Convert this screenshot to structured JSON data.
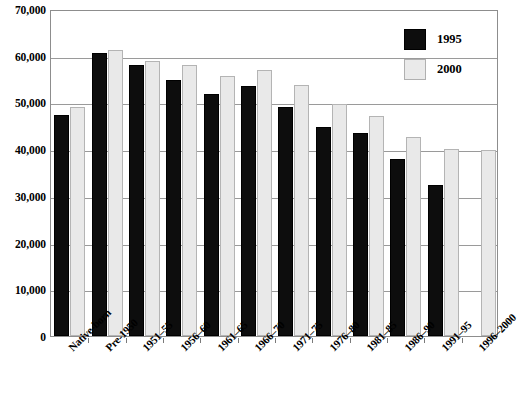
{
  "chart_data": {
    "type": "bar",
    "title": "",
    "xlabel": "",
    "ylabel": "",
    "ylim": [
      0,
      70000
    ],
    "yticks": [
      "0",
      "10,000",
      "20,000",
      "30,000",
      "40,000",
      "50,000",
      "60,000",
      "70,000"
    ],
    "ytick_values": [
      0,
      10000,
      20000,
      30000,
      40000,
      50000,
      60000,
      70000
    ],
    "grid": true,
    "legend_position": "top-right",
    "categories": [
      "Native-born",
      "Pre-1950",
      "1951–55",
      "1956–60",
      "1961–65",
      "1966–70",
      "1971–75",
      "1976–80",
      "1981–85",
      "1986–90",
      "1991–95",
      "1996–2000"
    ],
    "series": [
      {
        "name": "1995",
        "color": "#0d0d0d",
        "values": [
          47300,
          60600,
          58000,
          54700,
          51800,
          53500,
          49000,
          44800,
          43400,
          38000,
          32400,
          null
        ]
      },
      {
        "name": "2000",
        "color": "#e9e9e9",
        "values": [
          49100,
          61300,
          58800,
          58000,
          55600,
          57000,
          53700,
          49600,
          47000,
          42700,
          40100,
          39900
        ]
      }
    ]
  },
  "legend": {
    "entries": [
      {
        "label": "1995",
        "swatch": "black-square-icon"
      },
      {
        "label": "2000",
        "swatch": "light-square-icon"
      }
    ]
  }
}
